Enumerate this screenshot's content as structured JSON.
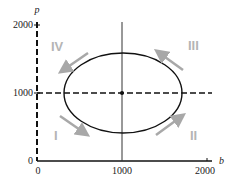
{
  "diagram": {
    "type": "phase-plane",
    "x_axis": {
      "label": "b",
      "ticks": [
        "0",
        "1000",
        "2000"
      ]
    },
    "y_axis": {
      "label": "p",
      "ticks": [
        "0",
        "1000",
        "2000"
      ]
    },
    "equilibrium": {
      "b": 1000,
      "p": 1000
    },
    "orbit": "closed ellipse centered at equilibrium, counterclockwise",
    "quadrants": [
      {
        "id": "I",
        "label": "I",
        "arrow": "down-right"
      },
      {
        "id": "II",
        "label": "II",
        "arrow": "up-right"
      },
      {
        "id": "III",
        "label": "III",
        "arrow": "up-left"
      },
      {
        "id": "IV",
        "label": "IV",
        "arrow": "down-left"
      }
    ],
    "colors": {
      "curve": "#111111",
      "arrow": "#a8a8a8",
      "quadrant_label": "#b5b5b5",
      "axis": "#111111"
    }
  }
}
